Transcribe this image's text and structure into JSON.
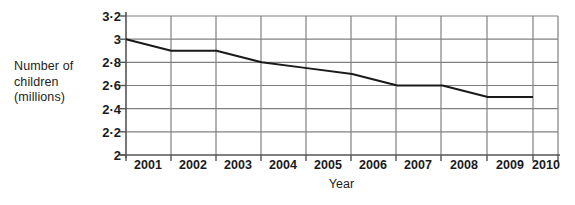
{
  "chart_data": {
    "type": "line",
    "title": "",
    "xlabel": "Year",
    "ylabel": "Number of children (millions)",
    "ylabel_lines": [
      "Number of",
      "children",
      "(millions)"
    ],
    "categories": [
      "2001",
      "2002",
      "2003",
      "2004",
      "2005",
      "2006",
      "2007",
      "2008",
      "2009",
      "2010"
    ],
    "x": [
      2001,
      2002,
      2003,
      2004,
      2005,
      2006,
      2007,
      2008,
      2009,
      2010
    ],
    "values": [
      3.0,
      2.9,
      2.9,
      2.8,
      2.75,
      2.7,
      2.6,
      2.6,
      2.5,
      2.5
    ],
    "series": [
      {
        "name": "Number of children (millions)",
        "values": [
          3.0,
          2.9,
          2.9,
          2.8,
          2.75,
          2.7,
          2.6,
          2.6,
          2.5,
          2.5
        ]
      }
    ],
    "ylim": [
      2.0,
      3.2
    ],
    "ytick_values": [
      2.0,
      2.2,
      2.4,
      2.6,
      2.8,
      3.0,
      3.2
    ],
    "ytick_labels": [
      "2",
      "2·2",
      "2·4",
      "2·6",
      "2·8",
      "3",
      "3·2"
    ],
    "xtick_labels": [
      "2001",
      "2002",
      "2003",
      "2004",
      "2005",
      "2006",
      "2007",
      "2008",
      "2009",
      "2010"
    ],
    "grid": true,
    "legend": "none",
    "line_color": "#1a1a1a",
    "grid_color": "#808080",
    "background_color": "#ffffff"
  }
}
